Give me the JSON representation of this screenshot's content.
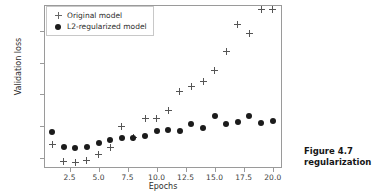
{
  "chart_data": {
    "type": "scatter",
    "title": "",
    "xlabel": "Epochs",
    "ylabel": "Validation loss",
    "xlim": [
      0.3,
      20.8
    ],
    "ylim": [
      0.268,
      0.782
    ],
    "grid": false,
    "legend_position": "upper left",
    "xticks": [
      "2.5",
      "5.0",
      "7.5",
      "10.0",
      "12.5",
      "15.0",
      "17.5",
      "20.0"
    ],
    "xtick_values": [
      2.5,
      5.0,
      7.5,
      10.0,
      12.5,
      15.0,
      17.5,
      20.0
    ],
    "yticks": [
      "0.3",
      "0.4",
      "0.5",
      "0.6",
      "0.7"
    ],
    "ytick_values": [
      0.3,
      0.4,
      0.5,
      0.6,
      0.7
    ],
    "x": [
      1,
      2,
      3,
      4,
      5,
      6,
      7,
      8,
      9,
      10,
      11,
      12,
      13,
      14,
      15,
      16,
      17,
      18,
      19,
      20
    ],
    "series": [
      {
        "name": "Original model",
        "marker": "plus",
        "color": "#555555",
        "values": [
          0.342,
          0.289,
          0.285,
          0.292,
          0.31,
          0.334,
          0.398,
          0.364,
          0.423,
          0.424,
          0.449,
          0.509,
          0.526,
          0.542,
          0.575,
          0.634,
          0.722,
          0.691,
          0.767,
          0.767
        ]
      },
      {
        "name": "L2-regularized model",
        "marker": "circle",
        "color": "#1b1b1b",
        "values": [
          0.382,
          0.334,
          0.33,
          0.334,
          0.348,
          0.356,
          0.362,
          0.362,
          0.369,
          0.385,
          0.387,
          0.384,
          0.406,
          0.395,
          0.432,
          0.406,
          0.414,
          0.433,
          0.41,
          0.416
        ]
      }
    ]
  },
  "legend": {
    "items": [
      {
        "label": "Original model",
        "marker": "plus"
      },
      {
        "label": "L2-regularized model",
        "marker": "circle"
      }
    ]
  },
  "caption": {
    "line1": "Figure 4.7",
    "line2": "regularization"
  }
}
